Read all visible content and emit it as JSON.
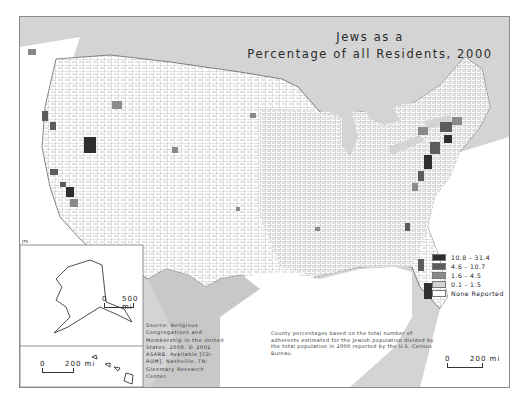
{
  "map": {
    "title_line1": "Jews as a",
    "title_line2": "Percentage of all Residents, 2000",
    "initials": "JTS",
    "legend": {
      "items": [
        {
          "label": "10.8 - 31.4",
          "color": "#2e2e2e"
        },
        {
          "label": "4.6 - 10.7",
          "color": "#5c5c5c"
        },
        {
          "label": "1.6 - 4.5",
          "color": "#8a8a8a"
        },
        {
          "label": "0.1 - 1.5",
          "color": "#d2d2d2"
        },
        {
          "label": "None Reported",
          "color": "#ffffff"
        }
      ]
    },
    "source_note": "Source: Religious Congregations and Membership in the United States, 2000. © 2002 ASARB. Available [CD-ROM]. Nashville, TN: Glenmary Research Center.",
    "method_note": "County percentages based on the total number of adherents estimated for the Jewish population divided by the total population in 2000 reported by the U.S. Census Bureau.",
    "scales": {
      "alaska": {
        "zero": "0",
        "label": "500 mi"
      },
      "hawaii": {
        "zero": "0",
        "label": "200 mi"
      },
      "conus": {
        "zero": "0",
        "label": "200 mi"
      }
    }
  }
}
